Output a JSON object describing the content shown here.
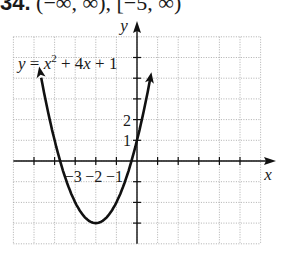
{
  "header": {
    "problem_number": "34.",
    "domain_range": "(−∞, ∞), [−5, ∞)"
  },
  "chart_data": {
    "type": "line",
    "title": "",
    "equation_label": "y = x² + 4x + 1",
    "xlabel": "x",
    "ylabel": "y",
    "xlim": [
      -6,
      6
    ],
    "ylim": [
      -4,
      6
    ],
    "grid": true,
    "x_tick_labels": [
      "−3",
      "−2",
      "−1"
    ],
    "x_tick_values": [
      -3,
      -2,
      -1
    ],
    "y_tick_labels": [
      "2",
      "1"
    ],
    "y_tick_values": [
      2,
      1
    ],
    "vertex": [
      -2,
      -3
    ],
    "curve_endpoints_y": 4,
    "series": [
      {
        "name": "y = x^2 + 4x + 1",
        "x": [
          -4.65,
          -4,
          -3.73,
          -3,
          -2,
          -1,
          -0.27,
          0,
          0.65
        ],
        "y": [
          4,
          1,
          0,
          -2,
          -3,
          -2,
          0,
          1,
          4
        ]
      }
    ],
    "colors": {
      "curve": "#111111",
      "axis": "#111111",
      "grid": "#9a9a9a"
    }
  }
}
